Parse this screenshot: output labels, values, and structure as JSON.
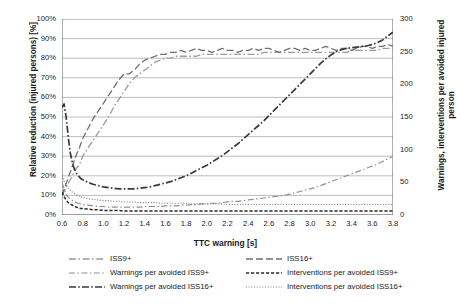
{
  "chart_data": {
    "type": "line",
    "title": "",
    "xlabel": "TTC warning [s]",
    "ylabel_left": "Relative reduction (injured persons) [%]",
    "ylabel_right": "Warnings, interventions per avoided injured person",
    "xlim": [
      0.6,
      3.8
    ],
    "ylim_left": [
      0,
      100
    ],
    "ylim_right": [
      0,
      300
    ],
    "grid": true,
    "legend_position": "bottom",
    "x_ticks": [
      "0.6",
      "0.8",
      "1.0",
      "1.2",
      "1.4",
      "1.6",
      "1.8",
      "2.0",
      "2.2",
      "2.4",
      "2.6",
      "2.8",
      "3.0",
      "3.2",
      "3.4",
      "3.6",
      "3.8"
    ],
    "y_ticks_left": [
      "0%",
      "10%",
      "20%",
      "30%",
      "40%",
      "50%",
      "60%",
      "70%",
      "80%",
      "90%",
      "100%"
    ],
    "y_ticks_right": [
      "0",
      "50",
      "100",
      "150",
      "200",
      "250",
      "300"
    ],
    "x": [
      0.6,
      0.62,
      0.64,
      0.66,
      0.68,
      0.7,
      0.72,
      0.74,
      0.76,
      0.78,
      0.8,
      0.85,
      0.9,
      0.95,
      1.0,
      1.05,
      1.1,
      1.15,
      1.2,
      1.25,
      1.3,
      1.35,
      1.4,
      1.45,
      1.5,
      1.55,
      1.6,
      1.65,
      1.7,
      1.75,
      1.8,
      1.85,
      1.9,
      1.95,
      2.0,
      2.05,
      2.1,
      2.15,
      2.2,
      2.25,
      2.3,
      2.35,
      2.4,
      2.45,
      2.5,
      2.55,
      2.6,
      2.65,
      2.7,
      2.75,
      2.8,
      2.85,
      2.9,
      2.95,
      3.0,
      3.05,
      3.1,
      3.15,
      3.2,
      3.25,
      3.3,
      3.35,
      3.4,
      3.45,
      3.5,
      3.55,
      3.6,
      3.65,
      3.7,
      3.75,
      3.8
    ],
    "series": [
      {
        "name": "ISS9+",
        "axis": "left",
        "units": "%",
        "style": "dash-dot-light",
        "color": "#9a9a9a",
        "values": [
          10,
          12,
          14,
          16,
          18,
          20,
          22,
          24,
          25,
          27,
          30,
          34,
          38,
          42,
          46,
          50,
          55,
          59,
          63,
          67,
          70,
          72,
          74,
          76,
          78,
          79,
          80,
          80,
          81,
          81,
          81,
          81,
          81,
          82,
          82,
          82,
          82,
          82,
          82,
          82,
          82,
          82,
          82,
          82,
          82,
          83,
          83,
          83,
          83,
          83,
          83,
          83,
          83,
          83,
          83,
          83,
          83,
          83,
          83,
          83,
          83,
          83,
          84,
          84,
          84,
          84,
          84,
          84,
          85,
          85,
          85
        ]
      },
      {
        "name": "ISS16+",
        "axis": "left",
        "units": "%",
        "style": "long-dash",
        "color": "#6f6f6f",
        "values": [
          10,
          13,
          16,
          19,
          22,
          25,
          28,
          31,
          33,
          36,
          39,
          44,
          49,
          53,
          57,
          61,
          65,
          69,
          72,
          72,
          74,
          77,
          79,
          80,
          81,
          82,
          82,
          83,
          83,
          84,
          83,
          84,
          85,
          84,
          84,
          83,
          84,
          85,
          84,
          84,
          83,
          84,
          84,
          85,
          84,
          85,
          85,
          84,
          83,
          84,
          85,
          85,
          84,
          85,
          84,
          84,
          85,
          86,
          85,
          84,
          85,
          85,
          84,
          85,
          86,
          86,
          85,
          86,
          86,
          87,
          86
        ]
      },
      {
        "name": "Warnings per avoided ISS9+",
        "axis": "right",
        "units": "count",
        "style": "dash-dot-mid",
        "color": "#909090",
        "values": [
          50,
          40,
          32,
          27,
          24,
          22,
          20,
          19,
          18,
          17,
          16,
          15,
          14,
          13,
          13,
          12,
          12,
          12,
          12,
          12,
          12,
          12,
          13,
          13,
          13,
          13,
          14,
          14,
          14,
          15,
          15,
          16,
          16,
          17,
          17,
          18,
          18,
          19,
          20,
          21,
          21,
          22,
          23,
          24,
          25,
          26,
          27,
          28,
          29,
          30,
          32,
          34,
          36,
          38,
          40,
          42,
          45,
          48,
          51,
          54,
          57,
          60,
          63,
          66,
          69,
          72,
          75,
          78,
          82,
          86,
          90
        ]
      },
      {
        "name": "Warnings per avoided ISS16+",
        "axis": "right",
        "units": "count",
        "style": "dash-dot-heavy",
        "color": "#3a3a3a",
        "values": [
          165,
          170,
          150,
          120,
          95,
          80,
          70,
          64,
          60,
          56,
          54,
          50,
          47,
          45,
          43,
          42,
          41,
          40,
          40,
          40,
          40,
          41,
          42,
          43,
          45,
          47,
          49,
          51,
          54,
          57,
          60,
          64,
          68,
          72,
          76,
          81,
          86,
          91,
          97,
          103,
          109,
          116,
          123,
          130,
          137,
          144,
          152,
          160,
          168,
          176,
          184,
          192,
          200,
          208,
          216,
          224,
          232,
          239,
          245,
          250,
          253,
          255,
          256,
          257,
          258,
          259,
          261,
          264,
          268,
          274,
          280
        ]
      },
      {
        "name": "Interventions per avoided ISS9+",
        "axis": "right",
        "units": "count",
        "style": "dashed-dark",
        "color": "#2b2b2b",
        "values": [
          35,
          28,
          23,
          19,
          17,
          15,
          13,
          12,
          11,
          10,
          10,
          9,
          8,
          8,
          7,
          7,
          7,
          7,
          6,
          6,
          6,
          6,
          6,
          6,
          6,
          6,
          6,
          6,
          6,
          6,
          6,
          6,
          6,
          6,
          6,
          6,
          6,
          6,
          6,
          6,
          6,
          6,
          6,
          6,
          6,
          6,
          6,
          6,
          6,
          6,
          6,
          6,
          6,
          6,
          6,
          6,
          6,
          6,
          6,
          6,
          6,
          6,
          6,
          6,
          6,
          6,
          6,
          6,
          6,
          6,
          6
        ]
      },
      {
        "name": "Interventions per avoided ISS16+",
        "axis": "right",
        "units": "count",
        "style": "dotted",
        "color": "#7a7a7a",
        "values": [
          60,
          52,
          46,
          41,
          38,
          35,
          33,
          31,
          29,
          28,
          27,
          25,
          24,
          23,
          22,
          22,
          21,
          21,
          20,
          20,
          20,
          19,
          19,
          19,
          19,
          18,
          18,
          18,
          18,
          18,
          18,
          17,
          17,
          17,
          17,
          17,
          17,
          17,
          16,
          16,
          16,
          16,
          16,
          16,
          16,
          16,
          16,
          16,
          16,
          16,
          16,
          16,
          16,
          16,
          16,
          16,
          16,
          16,
          16,
          16,
          16,
          16,
          16,
          16,
          16,
          16,
          16,
          16,
          16,
          16,
          16
        ]
      }
    ]
  },
  "axes": {
    "x_title": "TTC warning [s]",
    "y_left_title": "Relative reduction (injured persons) [%]",
    "y_right_title": "Warnings, interventions per avoided injured person"
  },
  "legend": {
    "col1": [
      {
        "label": "ISS9+",
        "key": "dash-dot-light"
      },
      {
        "label": "Warnings per avoided ISS9+",
        "key": "dash-dot-mid"
      },
      {
        "label": "Warnings per avoided ISS16+",
        "key": "dash-dot-heavy"
      }
    ],
    "col2": [
      {
        "label": "ISS16+",
        "key": "long-dash"
      },
      {
        "label": "Interventions per avoided ISS9+",
        "key": "dashed-dark"
      },
      {
        "label": "Interventions per avoided ISS16+",
        "key": "dotted"
      }
    ]
  }
}
